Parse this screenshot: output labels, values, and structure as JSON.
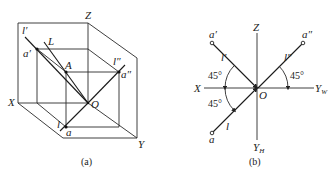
{
  "figure_a": {
    "caption": "(a)",
    "labels": {
      "Z": "Z",
      "X": "X",
      "Y": "Y",
      "O": "O",
      "L": "L",
      "A": "A",
      "l_prime": "l′",
      "l_double_prime": "l″",
      "l": "l",
      "a_prime": "a′",
      "a_double_prime": "a″",
      "a": "a"
    }
  },
  "figure_b": {
    "caption": "(b)",
    "labels": {
      "Z": "Z",
      "X": "X",
      "Y_W": "Y",
      "Y_W_sub": "W",
      "Y_H": "Y",
      "Y_H_sub": "H",
      "O": "O",
      "a_prime": "a′",
      "a_double_prime": "a″",
      "a": "a",
      "l_prime": "l′",
      "l_double_prime": "l″",
      "l": "l"
    },
    "angles": {
      "upper_left": "45°",
      "lower_left": "45°",
      "right": "45°"
    }
  },
  "colors": {
    "line": "#2a2a2a",
    "background": "#ffffff"
  }
}
